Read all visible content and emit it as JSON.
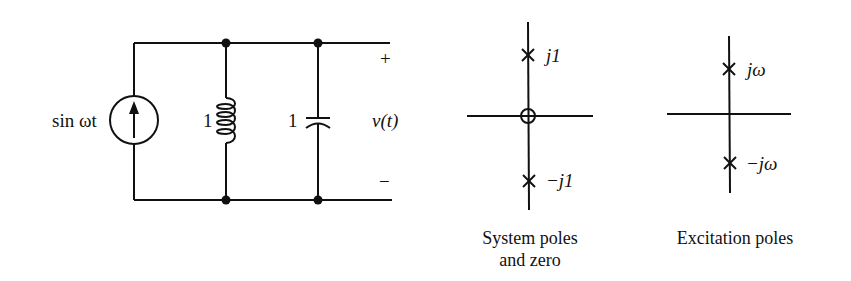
{
  "circuit": {
    "source_label": "sin ωt",
    "inductor_value": "1",
    "capacitor_value": "1",
    "output_label": "v(t)",
    "plus_sign": "+",
    "minus_sign": "−"
  },
  "system_plot": {
    "upper_pole_label": "j1",
    "lower_pole_label": "−j1",
    "caption_line1": "System poles",
    "caption_line2": "and zero"
  },
  "excitation_plot": {
    "upper_pole_label": "jω",
    "lower_pole_label": "−jω",
    "caption": "Excitation poles"
  },
  "colors": {
    "ink": "#111111",
    "background": "#ffffff"
  }
}
